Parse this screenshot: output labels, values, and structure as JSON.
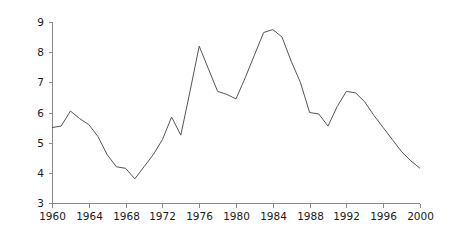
{
  "chart_data": {
    "type": "line",
    "title": "",
    "subtitle": "",
    "xlabel": "",
    "ylabel": "",
    "xlim": [
      1960,
      2000
    ],
    "ylim": [
      3,
      9
    ],
    "grid": false,
    "legend": null,
    "legend_position": "none",
    "line_color": "#555555",
    "axis_color": "#8a8a8a",
    "background_color": "#ffffff",
    "x_tick_labels": [
      "1960",
      "1964",
      "1968",
      "1972",
      "1976",
      "1980",
      "1984",
      "1988",
      "1992",
      "1996",
      "2000"
    ],
    "x_tick_values": [
      1960,
      1964,
      1968,
      1972,
      1976,
      1980,
      1984,
      1988,
      1992,
      1996,
      2000
    ],
    "y_tick_labels": [
      "3",
      "4",
      "5",
      "6",
      "7",
      "8",
      "9"
    ],
    "y_tick_values": [
      3,
      4,
      5,
      6,
      7,
      8,
      9
    ],
    "x_minor_step": 1,
    "series": [
      {
        "name": "series-1",
        "color": "#555555",
        "x": [
          1960,
          1961,
          1962,
          1963,
          1964,
          1965,
          1966,
          1967,
          1968,
          1969,
          1970,
          1971,
          1972,
          1973,
          1974,
          1975,
          1976,
          1977,
          1978,
          1979,
          1980,
          1981,
          1982,
          1983,
          1984,
          1985,
          1986,
          1987,
          1988,
          1989,
          1990,
          1991,
          1992,
          1993,
          1994,
          1995,
          1996,
          1997,
          1998,
          1999,
          2000
        ],
        "values": [
          5.5,
          5.55,
          6.05,
          5.8,
          5.6,
          5.2,
          4.6,
          4.2,
          4.15,
          3.8,
          4.2,
          4.6,
          5.1,
          5.85,
          5.25,
          6.7,
          8.2,
          7.45,
          6.7,
          6.6,
          6.45,
          7.15,
          7.9,
          8.65,
          8.75,
          8.5,
          7.7,
          7.0,
          6.0,
          5.95,
          5.55,
          6.2,
          6.7,
          6.65,
          6.35,
          5.9,
          5.5,
          5.1,
          4.7,
          4.4,
          4.15
        ]
      }
    ]
  },
  "geometry": {
    "plot_left": 52,
    "plot_right": 420,
    "plot_top": 22,
    "plot_bottom": 203,
    "tick_len": 4,
    "minor_tick_len": 3
  }
}
